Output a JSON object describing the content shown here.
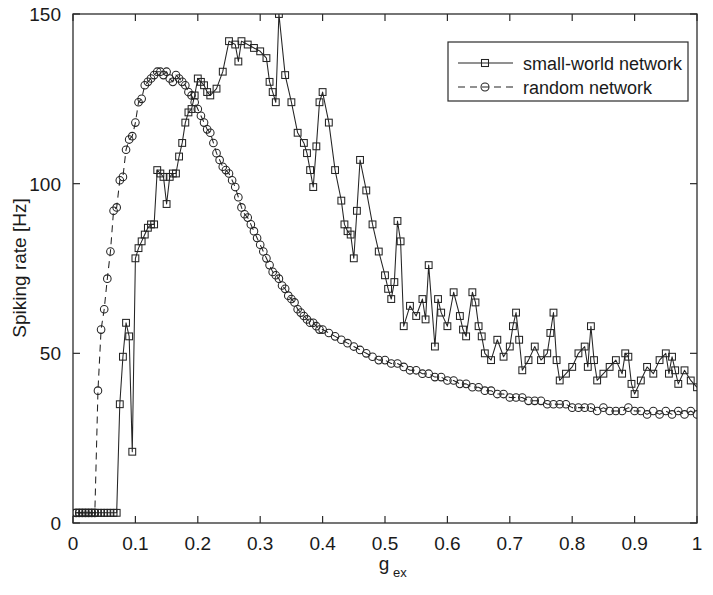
{
  "chart_data": {
    "type": "line",
    "title": "",
    "xlabel": "g_ex",
    "xlabel_base": "g",
    "xlabel_sub": "ex",
    "ylabel": "Spiking rate [Hz]",
    "xlim": [
      0,
      1
    ],
    "ylim": [
      0,
      150
    ],
    "xticks": [
      0,
      0.1,
      0.2,
      0.3,
      0.4,
      0.5,
      0.6,
      0.7,
      0.8,
      0.9,
      1
    ],
    "xticklabels": [
      "0",
      "0.1",
      "0.2",
      "0.3",
      "0.4",
      "0.5",
      "0.6",
      "0.7",
      "0.8",
      "0.9",
      "1"
    ],
    "yticks": [
      0,
      50,
      100,
      150
    ],
    "yticklabels": [
      "0",
      "50",
      "100",
      "150"
    ],
    "grid": false,
    "legend_position": "top-right",
    "series": [
      {
        "name": "small-world network",
        "marker": "square",
        "linestyle": "solid",
        "color": "#242424",
        "x": [
          0.005,
          0.01,
          0.015,
          0.02,
          0.025,
          0.03,
          0.035,
          0.04,
          0.045,
          0.05,
          0.055,
          0.06,
          0.065,
          0.07,
          0.075,
          0.08,
          0.085,
          0.09,
          0.095,
          0.1,
          0.105,
          0.11,
          0.115,
          0.12,
          0.125,
          0.13,
          0.135,
          0.14,
          0.145,
          0.15,
          0.155,
          0.16,
          0.165,
          0.17,
          0.175,
          0.18,
          0.185,
          0.19,
          0.195,
          0.2,
          0.205,
          0.21,
          0.215,
          0.22,
          0.23,
          0.24,
          0.25,
          0.26,
          0.265,
          0.27,
          0.28,
          0.29,
          0.3,
          0.31,
          0.315,
          0.32,
          0.325,
          0.33,
          0.34,
          0.35,
          0.36,
          0.37,
          0.375,
          0.38,
          0.385,
          0.39,
          0.395,
          0.4,
          0.41,
          0.42,
          0.43,
          0.435,
          0.44,
          0.445,
          0.45,
          0.455,
          0.46,
          0.47,
          0.48,
          0.49,
          0.5,
          0.505,
          0.51,
          0.515,
          0.52,
          0.525,
          0.53,
          0.54,
          0.55,
          0.56,
          0.565,
          0.57,
          0.58,
          0.585,
          0.59,
          0.6,
          0.61,
          0.62,
          0.625,
          0.63,
          0.64,
          0.645,
          0.65,
          0.655,
          0.66,
          0.67,
          0.68,
          0.69,
          0.7,
          0.705,
          0.71,
          0.715,
          0.72,
          0.73,
          0.74,
          0.75,
          0.76,
          0.765,
          0.77,
          0.775,
          0.78,
          0.79,
          0.8,
          0.81,
          0.82,
          0.825,
          0.83,
          0.835,
          0.84,
          0.85,
          0.86,
          0.87,
          0.88,
          0.885,
          0.89,
          0.895,
          0.9,
          0.91,
          0.92,
          0.93,
          0.94,
          0.95,
          0.955,
          0.96,
          0.965,
          0.97,
          0.98,
          0.99,
          1.0
        ],
        "y": [
          3,
          3,
          3,
          3,
          3,
          3,
          3,
          3,
          3,
          3,
          3,
          3,
          3,
          3,
          35,
          49,
          59,
          55,
          21,
          78,
          81,
          83,
          85,
          87,
          88,
          88,
          104,
          103,
          102,
          94,
          102,
          103,
          103,
          108,
          112,
          118,
          121,
          122,
          126,
          131,
          130,
          129,
          127,
          126,
          128,
          133,
          142,
          141,
          136,
          142,
          141,
          140,
          139,
          137,
          130,
          127,
          124,
          150,
          132,
          124,
          115,
          112,
          109,
          104,
          99,
          111,
          124,
          127,
          118,
          104,
          95,
          88,
          86,
          85,
          78,
          92,
          107,
          98,
          88,
          80,
          73,
          69,
          66,
          71,
          89,
          83,
          58,
          64,
          61,
          66,
          60,
          76,
          52,
          66,
          62,
          58,
          68,
          61,
          57,
          55,
          68,
          65,
          58,
          55,
          50,
          48,
          54,
          49,
          52,
          58,
          62,
          54,
          45,
          48,
          52,
          48,
          50,
          56,
          62,
          48,
          42,
          44,
          46,
          50,
          52,
          46,
          58,
          48,
          42,
          44,
          46,
          48,
          44,
          50,
          49,
          41,
          38,
          42,
          46,
          44,
          48,
          50,
          44,
          49,
          45,
          41,
          45,
          42,
          40
        ]
      },
      {
        "name": "random network",
        "marker": "circle",
        "linestyle": "dashed",
        "color": "#242424",
        "x": [
          0.005,
          0.01,
          0.015,
          0.02,
          0.025,
          0.03,
          0.035,
          0.04,
          0.045,
          0.05,
          0.055,
          0.06,
          0.065,
          0.07,
          0.075,
          0.08,
          0.085,
          0.09,
          0.095,
          0.1,
          0.105,
          0.11,
          0.115,
          0.12,
          0.125,
          0.13,
          0.135,
          0.14,
          0.145,
          0.15,
          0.155,
          0.16,
          0.165,
          0.17,
          0.175,
          0.18,
          0.185,
          0.19,
          0.195,
          0.2,
          0.205,
          0.21,
          0.215,
          0.22,
          0.225,
          0.23,
          0.235,
          0.24,
          0.245,
          0.25,
          0.255,
          0.26,
          0.265,
          0.27,
          0.275,
          0.28,
          0.285,
          0.29,
          0.295,
          0.3,
          0.305,
          0.31,
          0.315,
          0.32,
          0.325,
          0.33,
          0.335,
          0.34,
          0.345,
          0.35,
          0.355,
          0.36,
          0.365,
          0.37,
          0.375,
          0.38,
          0.385,
          0.39,
          0.395,
          0.4,
          0.41,
          0.42,
          0.43,
          0.44,
          0.45,
          0.46,
          0.47,
          0.48,
          0.49,
          0.5,
          0.51,
          0.52,
          0.53,
          0.54,
          0.55,
          0.56,
          0.57,
          0.58,
          0.59,
          0.6,
          0.61,
          0.62,
          0.63,
          0.64,
          0.65,
          0.66,
          0.67,
          0.68,
          0.69,
          0.7,
          0.71,
          0.72,
          0.73,
          0.74,
          0.75,
          0.76,
          0.77,
          0.78,
          0.79,
          0.8,
          0.81,
          0.82,
          0.83,
          0.84,
          0.85,
          0.86,
          0.87,
          0.88,
          0.89,
          0.9,
          0.91,
          0.92,
          0.93,
          0.94,
          0.95,
          0.96,
          0.97,
          0.98,
          0.99,
          1.0
        ],
        "y": [
          3,
          3,
          3,
          3,
          3,
          3,
          3,
          39,
          57,
          63,
          72,
          80,
          92,
          93,
          101,
          102,
          110,
          113,
          114,
          118,
          124,
          125,
          129,
          130,
          131,
          132,
          133,
          133,
          132,
          133,
          131,
          130,
          132,
          131,
          130,
          129,
          127,
          126,
          124,
          122,
          120,
          118,
          116,
          115,
          112,
          109,
          107,
          105,
          104,
          103,
          101,
          99,
          96,
          93,
          91,
          90,
          88,
          86,
          84,
          82,
          80,
          78,
          76,
          74,
          73,
          72,
          70,
          69,
          67,
          66,
          65,
          63,
          62,
          61,
          60,
          59,
          59,
          58,
          57,
          57,
          56,
          55,
          54,
          53,
          52,
          51,
          50,
          49,
          48,
          48,
          47,
          47,
          46,
          45,
          45,
          44,
          44,
          43,
          43,
          42,
          42,
          41,
          41,
          40,
          40,
          39,
          39,
          38,
          38,
          37,
          37,
          37,
          36,
          36,
          36,
          35,
          35,
          35,
          35,
          34,
          34,
          34,
          34,
          33,
          34,
          33,
          33,
          33,
          34,
          33,
          33,
          32,
          33,
          32,
          33,
          32,
          33,
          32,
          33,
          32
        ]
      }
    ]
  },
  "legend": {
    "entries": [
      {
        "label": "small-world network",
        "marker": "square",
        "style": "solid"
      },
      {
        "label": "random network",
        "marker": "circle",
        "style": "dashed"
      }
    ]
  }
}
